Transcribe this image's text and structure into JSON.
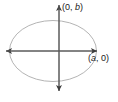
{
  "figure": {
    "type": "coordinate-diagram",
    "background_color": "#ffffff",
    "canvas": {
      "width": 118,
      "height": 102
    }
  },
  "chart_data": {
    "type": "scatter",
    "title": "",
    "xlabel": "",
    "ylabel": "",
    "grid": false,
    "legend": null,
    "origin": {
      "x": 59,
      "y": 51
    },
    "curve": {
      "name": "ellipse",
      "center_x": 53,
      "center_y": 51,
      "semi_axis_x": 44,
      "semi_axis_y": 31,
      "stroke_color": "#b4b4b4",
      "stroke_width": 1,
      "fill": "none"
    },
    "axes": {
      "stroke_color": "#5a5a5a",
      "stroke_width": 1,
      "horizontal": {
        "x1": 5,
        "y1": 51,
        "x2": 98,
        "y2": 51,
        "arrow_start": true,
        "arrow_end": true
      },
      "vertical": {
        "x1": 59,
        "y1": 4,
        "x2": 59,
        "y2": 92,
        "arrow_start": true,
        "arrow_end": true
      }
    },
    "annotations": [
      {
        "id": "vertex-top",
        "text": "(0, b)",
        "prefix": "(0, ",
        "variable": "b",
        "suffix": ")",
        "x": 62,
        "y": 2,
        "point_x": 0,
        "point_y": "b"
      },
      {
        "id": "vertex-right",
        "text": "(a, 0)",
        "prefix": "(",
        "variable": "a",
        "suffix": ", 0)",
        "x": 88,
        "y": 53,
        "point_x": "a",
        "point_y": 0
      }
    ]
  }
}
